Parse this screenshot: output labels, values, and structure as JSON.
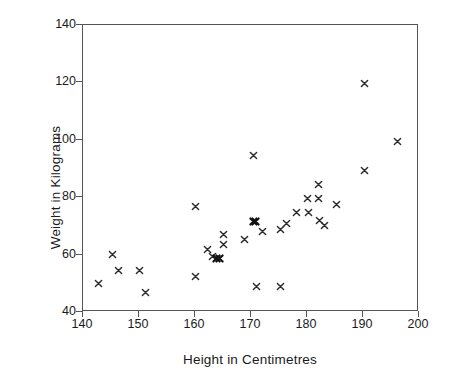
{
  "chart_data": {
    "type": "scatter",
    "title": "",
    "xlabel": "Height in Centimetres",
    "ylabel": "Weight in Kilograms",
    "xlim": [
      140,
      200
    ],
    "ylim": [
      40,
      140
    ],
    "xticks": [
      140,
      150,
      160,
      170,
      180,
      190,
      200
    ],
    "yticks": [
      40,
      60,
      80,
      100,
      120,
      140
    ],
    "grid": false,
    "legend": null,
    "marker": "x",
    "marker_color": "#2b2b2b",
    "series": [
      {
        "name": "Height vs Weight",
        "points": [
          {
            "x": 142.7,
            "y": 50.0
          },
          {
            "x": 145.3,
            "y": 59.9
          },
          {
            "x": 146.3,
            "y": 54.6
          },
          {
            "x": 150.0,
            "y": 54.6
          },
          {
            "x": 151.2,
            "y": 46.7
          },
          {
            "x": 160.1,
            "y": 76.9
          },
          {
            "x": 160.1,
            "y": 52.2
          },
          {
            "x": 162.3,
            "y": 61.7
          },
          {
            "x": 163.2,
            "y": 59.5
          },
          {
            "x": 163.9,
            "y": 58.6
          },
          {
            "x": 164.3,
            "y": 58.6
          },
          {
            "x": 165.1,
            "y": 66.9
          },
          {
            "x": 165.1,
            "y": 63.6
          },
          {
            "x": 168.9,
            "y": 65.1
          },
          {
            "x": 170.4,
            "y": 94.5
          },
          {
            "x": 170.4,
            "y": 71.4
          },
          {
            "x": 170.8,
            "y": 71.4
          },
          {
            "x": 171.0,
            "y": 48.9
          },
          {
            "x": 172.0,
            "y": 67.9
          },
          {
            "x": 175.2,
            "y": 48.9
          },
          {
            "x": 175.3,
            "y": 68.9
          },
          {
            "x": 176.3,
            "y": 70.9
          },
          {
            "x": 178.2,
            "y": 74.6
          },
          {
            "x": 180.0,
            "y": 79.7
          },
          {
            "x": 180.2,
            "y": 74.8
          },
          {
            "x": 182.1,
            "y": 84.4
          },
          {
            "x": 182.1,
            "y": 79.7
          },
          {
            "x": 182.3,
            "y": 72.0
          },
          {
            "x": 183.1,
            "y": 70.0
          },
          {
            "x": 185.3,
            "y": 77.6
          },
          {
            "x": 190.2,
            "y": 119.5
          },
          {
            "x": 190.2,
            "y": 89.4
          },
          {
            "x": 196.2,
            "y": 99.5
          }
        ],
        "overlapping_pairs": [
          {
            "x": 170.6,
            "y": 71.4,
            "count": 2
          },
          {
            "x": 164.1,
            "y": 58.6,
            "count": 2
          }
        ]
      }
    ]
  }
}
